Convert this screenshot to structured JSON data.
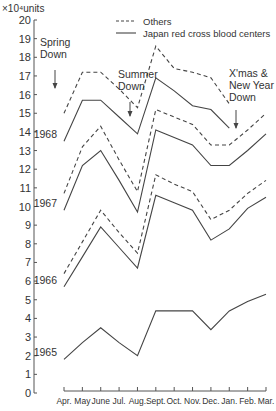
{
  "chart_data": {
    "type": "line",
    "title": "",
    "ylabel": "×10⁴units",
    "xlabel": "",
    "ylim": [
      0,
      20
    ],
    "yticks": [
      0,
      1,
      2,
      3,
      4,
      5,
      6,
      7,
      8,
      9,
      10,
      11,
      12,
      13,
      14,
      15,
      16,
      17,
      18,
      19,
      20
    ],
    "categories": [
      "Apr.",
      "May",
      "June",
      "Jul.",
      "Aug.",
      "Sept.",
      "Oct.",
      "Nov.",
      "Dec.",
      "Jan.",
      "Feb.",
      "Mar."
    ],
    "legend": [
      {
        "label": "Others",
        "style": "dashed"
      },
      {
        "label": "Japan red cross blood centers",
        "style": "solid"
      }
    ],
    "series": [
      {
        "name": "1968 Japan red cross blood centers",
        "style": "solid",
        "year_label": "1968",
        "values": [
          13.5,
          15.7,
          15.7,
          14.8,
          13.9,
          16.9,
          16.2,
          15.4,
          15.2,
          14.2,
          null,
          null
        ]
      },
      {
        "name": "1968 Others",
        "style": "dashed",
        "values": [
          15.0,
          17.2,
          17.2,
          16.3,
          15.3,
          18.6,
          17.4,
          17.2,
          16.9,
          15.5,
          null,
          null
        ]
      },
      {
        "name": "1967 Japan red cross blood centers",
        "style": "solid",
        "year_label": "1967",
        "values": [
          9.8,
          12.2,
          13.0,
          11.4,
          9.7,
          14.1,
          13.7,
          13.3,
          12.2,
          12.2,
          13.0,
          13.9
        ]
      },
      {
        "name": "1967 Others",
        "style": "dashed",
        "values": [
          10.7,
          13.2,
          14.3,
          12.5,
          10.8,
          15.2,
          14.8,
          14.4,
          13.3,
          13.3,
          14.1,
          15.0
        ]
      },
      {
        "name": "1966 Japan red cross blood centers",
        "style": "solid",
        "year_label": "1966",
        "values": [
          5.7,
          7.3,
          8.9,
          7.8,
          6.7,
          10.6,
          10.2,
          9.8,
          8.2,
          8.8,
          9.9,
          10.5
        ]
      },
      {
        "name": "1966 Others",
        "style": "dashed",
        "values": [
          6.4,
          8.1,
          9.8,
          8.6,
          7.5,
          11.7,
          11.2,
          10.8,
          9.3,
          9.8,
          10.7,
          11.4
        ]
      },
      {
        "name": "1965 Japan red cross blood centers",
        "style": "solid",
        "year_label": "1965",
        "values": [
          1.8,
          2.7,
          3.5,
          2.7,
          2.0,
          4.4,
          4.4,
          4.4,
          3.4,
          4.4,
          4.9,
          5.3
        ]
      }
    ],
    "annotations": [
      {
        "text": [
          "Spring",
          "Down"
        ],
        "at": "May"
      },
      {
        "text": [
          "Summer",
          "Down"
        ],
        "at": "Aug."
      },
      {
        "text": [
          "X'mas &",
          "New Year",
          "Down"
        ],
        "at": "Jan."
      }
    ],
    "grid": false,
    "legend_position": "top-right"
  }
}
